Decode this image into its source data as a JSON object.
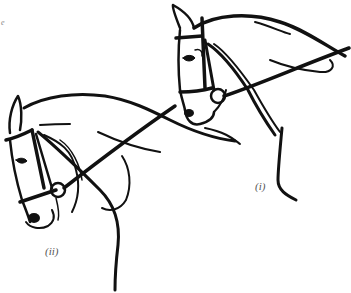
{
  "figure": {
    "stroke_color": "#111111",
    "background": "#ffffff",
    "corner_fragment": "e",
    "labels": {
      "first": "(i)",
      "second": "(ii)"
    }
  }
}
